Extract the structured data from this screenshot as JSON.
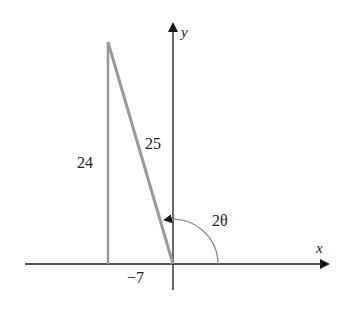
{
  "diagram": {
    "type": "right-triangle-on-axes",
    "axes": {
      "x_label": "x",
      "y_label": "y"
    },
    "triangle": {
      "vertical_leg_label": "24",
      "hypotenuse_label": "25",
      "horizontal_leg_label": "−7"
    },
    "angle_label": "2θ",
    "colors": {
      "axis": "#1a1a1a",
      "triangle": "#9a9a9a",
      "arc": "#8a8a8a"
    }
  }
}
